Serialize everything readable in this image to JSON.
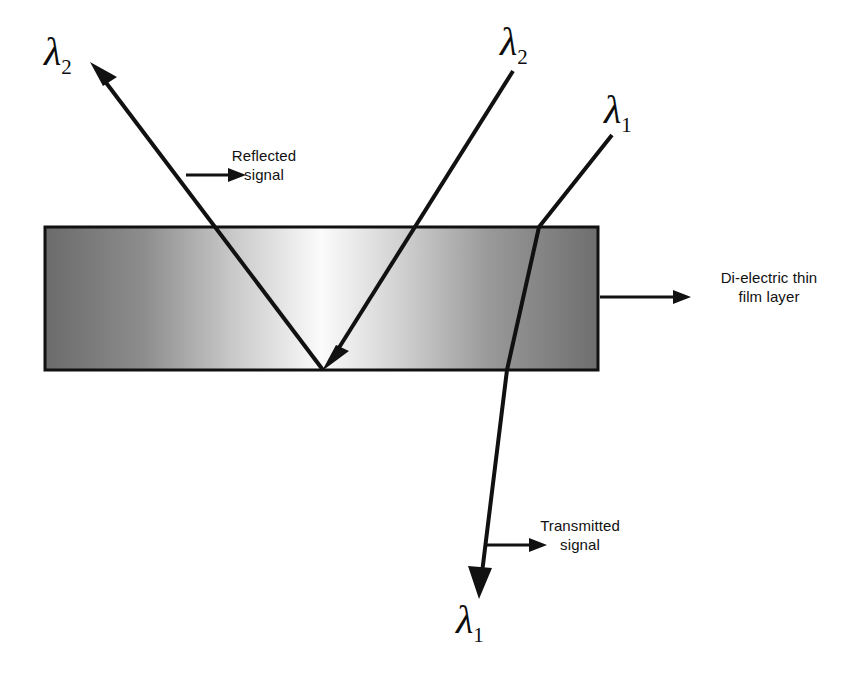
{
  "figure": {
    "kind": "optics-ray-diagram",
    "background_color": "#ffffff",
    "line_color": "#111111"
  },
  "slab": {
    "name": "Di-electric thin film layer",
    "x": 45,
    "y": 227,
    "width": 553,
    "height": 143,
    "border_color": "#111111",
    "gradient": {
      "type": "linear-horizontal",
      "stops": [
        {
          "offset": "0%",
          "color": "#6b6b6b"
        },
        {
          "offset": "18%",
          "color": "#8d8d8d"
        },
        {
          "offset": "34%",
          "color": "#c9c9c9"
        },
        {
          "offset": "50%",
          "color": "#fbfbfb"
        },
        {
          "offset": "64%",
          "color": "#d2d2d2"
        },
        {
          "offset": "80%",
          "color": "#9a9a9a"
        },
        {
          "offset": "100%",
          "color": "#6e6e6e"
        }
      ]
    }
  },
  "labels": {
    "reflected": "Reflected\nsignal",
    "dielectric": "Di-electric thin\nfilm layer",
    "transmitted": "Transmitted\nsignal"
  },
  "symbols": {
    "lambda": "λ",
    "sub_one": "1",
    "sub_two": "2"
  },
  "rays": [
    {
      "id": "lambda2-incident",
      "symbol": "λ",
      "subscript": "2",
      "label_position": "top-right",
      "description": "Incident beam of wavelength lambda-2 travelling down-left onto the film",
      "arrowhead": "end"
    },
    {
      "id": "lambda2-reflected",
      "symbol": "λ",
      "subscript": "2",
      "label_position": "top-left",
      "description": "Reflected beam of wavelength lambda-2 leaving up-left",
      "arrowhead": "end"
    },
    {
      "id": "lambda1-transmitted",
      "symbol": "λ",
      "subscript": "1",
      "label_position": "top-right-and-bottom",
      "description": "Beam of wavelength lambda-1 refracting through the film and transmitting downward",
      "arrowhead": "end"
    }
  ],
  "pointers": [
    {
      "id": "reflected-pointer",
      "from_x": 186,
      "from_y": 175,
      "to_x": 244,
      "to_y": 175
    },
    {
      "id": "dielectric-pointer",
      "from_x": 600,
      "from_y": 297,
      "to_x": 690,
      "to_y": 297
    },
    {
      "id": "transmitted-pointer",
      "from_x": 487,
      "from_y": 545,
      "to_x": 546,
      "to_y": 545
    }
  ]
}
